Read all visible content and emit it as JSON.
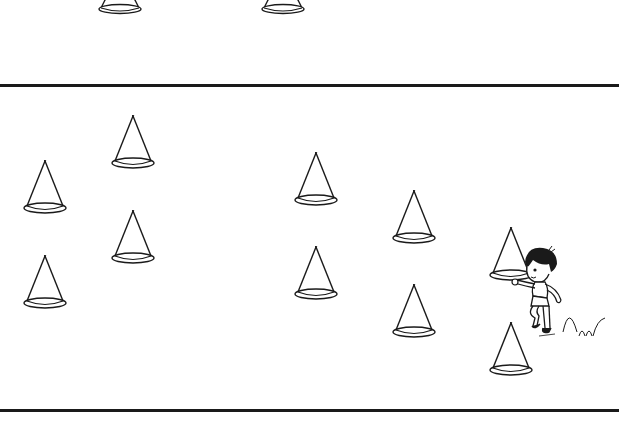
{
  "illustration": {
    "description": "Worksheet-style line drawing of traffic cones on a field with a child running between cones",
    "panel_label_fragment": ")",
    "colors": {
      "line": "#1a1a1a",
      "background": "#ffffff"
    },
    "top_panel": {
      "cones_partial": [
        {
          "id": "top-1",
          "x": 120,
          "y": 0
        },
        {
          "id": "top-2",
          "x": 283,
          "y": 0
        }
      ]
    },
    "main_panel": {
      "cones": [
        {
          "id": "c1",
          "x": 133,
          "y": 115
        },
        {
          "id": "c2",
          "x": 45,
          "y": 160
        },
        {
          "id": "c3",
          "x": 133,
          "y": 210
        },
        {
          "id": "c4",
          "x": 45,
          "y": 255
        },
        {
          "id": "c5",
          "x": 316,
          "y": 152
        },
        {
          "id": "c6",
          "x": 414,
          "y": 190
        },
        {
          "id": "c7",
          "x": 316,
          "y": 246
        },
        {
          "id": "c8",
          "x": 414,
          "y": 284
        },
        {
          "id": "c9",
          "x": 511,
          "y": 227
        },
        {
          "id": "c10",
          "x": 511,
          "y": 322
        }
      ],
      "figure": "child-running-past-cone",
      "motion_trail": "bouncing-arc-lines"
    }
  }
}
